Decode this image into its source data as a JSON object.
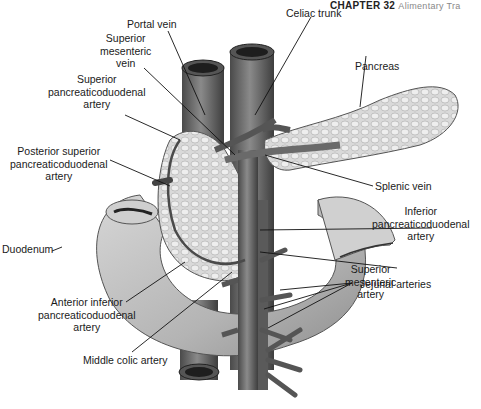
{
  "header": {
    "chapter": "CHAPTER 32",
    "title": "Alimentary Tra"
  },
  "figure": {
    "labels": [
      {
        "id": "portal-vein",
        "lines": [
          "Portal vein"
        ]
      },
      {
        "id": "celiac-trunk",
        "lines": [
          "Celiac trunk"
        ]
      },
      {
        "id": "superior-mesenteric-vein",
        "lines": [
          "Superior",
          "mesenteric",
          "vein"
        ]
      },
      {
        "id": "pancreas",
        "lines": [
          "Pancreas"
        ]
      },
      {
        "id": "superior-pancreaticoduodenal-artery",
        "lines": [
          "Superior",
          "pancreaticoduodenal",
          "artery"
        ]
      },
      {
        "id": "posterior-superior-pancreaticoduodenal-artery",
        "lines": [
          "Posterior superior",
          "pancreaticoduodenal",
          "artery"
        ]
      },
      {
        "id": "splenic-vein",
        "lines": [
          "Splenic vein"
        ]
      },
      {
        "id": "inferior-pancreaticoduodenal-artery",
        "lines": [
          "Inferior",
          "pancreaticoduodenal",
          "artery"
        ]
      },
      {
        "id": "duodenum",
        "lines": [
          "Duodenum"
        ]
      },
      {
        "id": "superior-mesenteric-artery",
        "lines": [
          "Superior",
          "mesenteric",
          "artery"
        ]
      },
      {
        "id": "anterior-inferior-pancreaticoduodenal-artery",
        "lines": [
          "Anterior inferior",
          "pancreaticoduodenal",
          "artery"
        ]
      },
      {
        "id": "jejunal-arteries",
        "lines": [
          "Jejunal arteries"
        ]
      },
      {
        "id": "middle-colic-artery",
        "lines": [
          "Middle colic artery"
        ]
      }
    ]
  }
}
